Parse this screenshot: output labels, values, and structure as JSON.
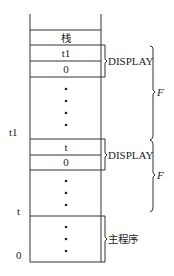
{
  "diagram": {
    "title": "",
    "stack": {
      "cells": [
        {
          "id": "stack-header",
          "label": "栈"
        },
        {
          "id": "display1-top",
          "label": "t1"
        },
        {
          "id": "display1-bottom",
          "label": "0"
        },
        {
          "id": "display2-top",
          "label": "t"
        },
        {
          "id": "display2-bottom",
          "label": "0"
        }
      ],
      "ellipsis_dot": "•"
    },
    "left_labels": {
      "t1": "t1",
      "t": "t",
      "zero": "0"
    },
    "groups": {
      "display1": "DISPLAY",
      "display2": "DISPLAY",
      "main_program": "主程序"
    },
    "frames": {
      "frame1": "F",
      "frame2": "F"
    },
    "colors": {
      "line": "#333333",
      "background": "#ffffff",
      "text": "#222222"
    }
  }
}
